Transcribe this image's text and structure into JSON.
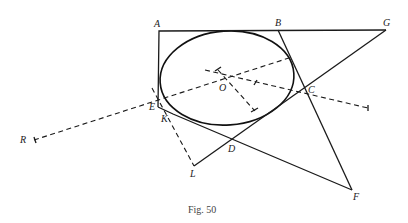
{
  "figure": {
    "caption": "Fig. 50",
    "points": {
      "A": {
        "label": "A",
        "x": 159,
        "y": 31
      },
      "B": {
        "label": "B",
        "x": 278,
        "y": 30
      },
      "G": {
        "label": "G",
        "x": 386,
        "y": 30
      },
      "E": {
        "label": "E",
        "x": 158,
        "y": 107
      },
      "K": {
        "label": "K",
        "x": 173,
        "y": 114
      },
      "L": {
        "label": "L",
        "x": 194,
        "y": 166
      },
      "D": {
        "label": "D",
        "x": 231,
        "y": 148
      },
      "F": {
        "label": "F",
        "x": 352,
        "y": 190
      },
      "C": {
        "label": "C",
        "x": 306,
        "y": 89
      },
      "O": {
        "label": "O",
        "x": 227,
        "y": 79
      },
      "R": {
        "label": "R",
        "x": 32,
        "y": 140
      }
    },
    "ellipse": {
      "cx": 227,
      "cy": 78,
      "rx": 67,
      "ry": 47,
      "rotation": -4
    },
    "colors": {
      "ink": "#1a1a1a",
      "background": "#ffffff"
    }
  }
}
